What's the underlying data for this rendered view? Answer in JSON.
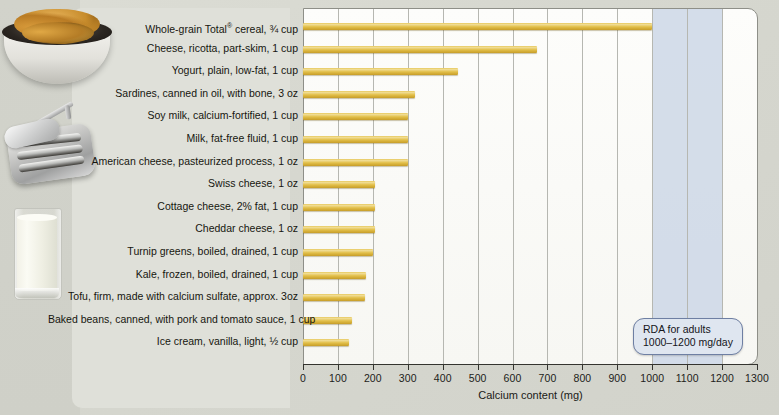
{
  "chart_data": {
    "type": "bar",
    "orientation": "horizontal",
    "title": "",
    "xlabel": "Calcium content (mg)",
    "ylabel": "",
    "xlim": [
      0,
      1300
    ],
    "xticks": [
      0,
      100,
      200,
      300,
      400,
      500,
      600,
      700,
      800,
      900,
      1000,
      1100,
      1200,
      1300
    ],
    "xtick_labels": [
      "0",
      "100",
      "200",
      "300",
      "400",
      "500",
      "600",
      "700",
      "800",
      "900",
      "1000",
      "1100",
      "1200",
      "1300"
    ],
    "grid": true,
    "legend": false,
    "bar_color": "#e2bf49",
    "categories": [
      "Whole-grain Total® cereal, ¾ cup",
      "Cheese, ricotta, part-skim, 1 cup",
      "Yogurt, plain, low-fat, 1 cup",
      "Sardines, canned in oil, with bone, 3 oz",
      "Soy milk, calcium-fortified, 1 cup",
      "Milk, fat-free fluid, 1 cup",
      "American cheese, pasteurized process, 1 oz",
      "Swiss cheese, 1 oz",
      "Cottage cheese, 2% fat, 1 cup",
      "Cheddar cheese, 1 oz",
      "Turnip greens, boiled, drained, 1 cup",
      "Kale, frozen, boiled, drained, 1 cup",
      "Tofu, firm, made with calcium sulfate, approx. 3oz",
      "Baked beans, canned, with pork and tomato sauce, 1 cup",
      "Ice cream, vanilla, light, ½ cup"
    ],
    "values": [
      1000,
      670,
      445,
      320,
      300,
      300,
      300,
      205,
      205,
      205,
      200,
      180,
      178,
      140,
      132
    ],
    "annotations": [
      {
        "name": "rda-band",
        "type": "vspan",
        "x_start": 1000,
        "x_end": 1200,
        "color": "#ccd7e6",
        "label_line1": "RDA for adults",
        "label_line2": "1000–1200 mg/day"
      }
    ]
  },
  "axis": {
    "x_title": "Calcium content (mg)"
  },
  "rda_callout": {
    "line1": "RDA for adults",
    "line2": "1000–1200 mg/day"
  },
  "photos": [
    {
      "name": "cereal-bowl-photo",
      "alt": "bowl of whole-grain cereal flakes"
    },
    {
      "name": "sardine-tin-photo",
      "alt": "open tin of sardines"
    },
    {
      "name": "milk-glass-photo",
      "alt": "glass of milk"
    }
  ]
}
